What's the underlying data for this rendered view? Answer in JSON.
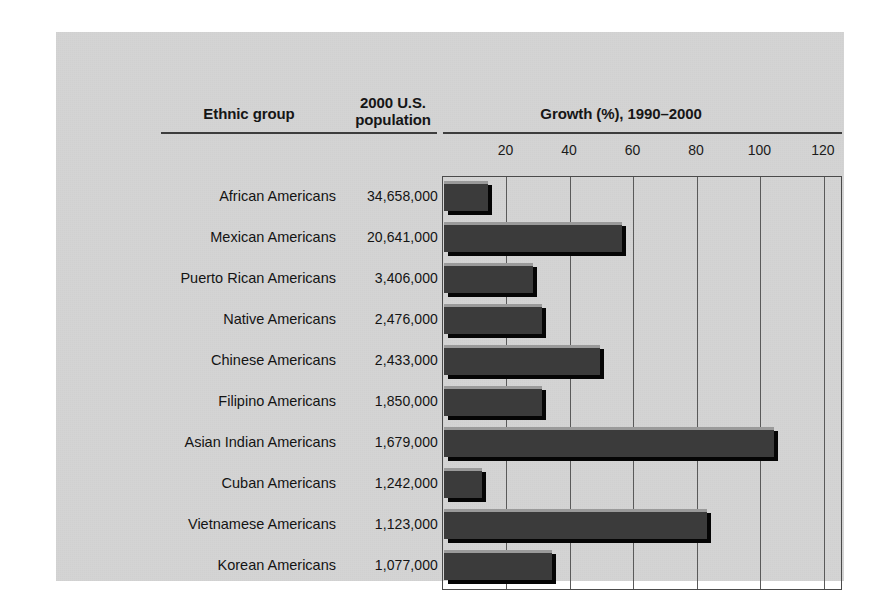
{
  "figure": {
    "background_color": "#ffffff",
    "panel_color": "#d4d4d4",
    "bar_color": "#3b3b3b",
    "axis_color": "#4a4a4a"
  },
  "headers": {
    "ethnic_group": "Ethnic group",
    "population_line1": "2000 U.S.",
    "population_line2": "population",
    "growth": "Growth (%), 1990–2000"
  },
  "chart_data": {
    "type": "bar",
    "orientation": "horizontal",
    "title": "Growth (%), 1990–2000",
    "xlabel": "",
    "ylabel": "",
    "xlim": [
      0,
      126
    ],
    "ticks": [
      20,
      40,
      60,
      80,
      100,
      120
    ],
    "tick_labels": [
      "20",
      "40",
      "60",
      "80",
      "100",
      "120"
    ],
    "grid": true,
    "legend": null,
    "categories": [
      "African Americans",
      "Mexican Americans",
      "Puerto Rican Americans",
      "Native Americans",
      "Chinese Americans",
      "Filipino Americans",
      "Asian Indian Americans",
      "Cuban Americans",
      "Vietnamese Americans",
      "Korean Americans"
    ],
    "values": [
      14,
      56,
      28,
      31,
      49,
      31,
      104,
      12,
      83,
      34
    ],
    "populations": [
      "34,658,000",
      "20,641,000",
      "3,406,000",
      "2,476,000",
      "2,433,000",
      "1,850,000",
      "1,679,000",
      "1,242,000",
      "1,123,000",
      "1,077,000"
    ]
  }
}
